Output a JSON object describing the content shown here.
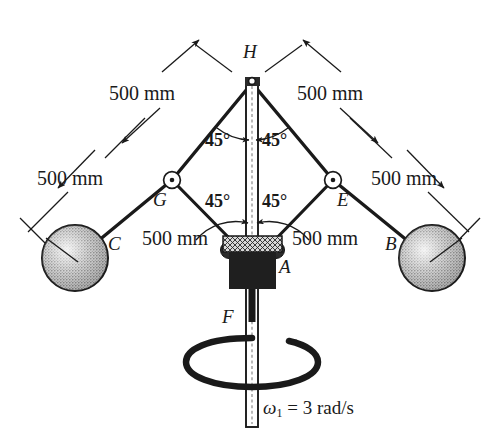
{
  "figure": {
    "type": "mechanism-diagram",
    "background_color": "#ffffff",
    "line_color": "#1a1a1a",
    "sphere_fill": "#b8b8b8"
  },
  "points": {
    "H": "H",
    "G": "G",
    "E": "E",
    "A": "A",
    "B": "B",
    "C": "C",
    "F": "F"
  },
  "dimensions": {
    "upper_left": "500 mm",
    "upper_right": "500 mm",
    "lower_left": "500 mm",
    "lower_right": "500 mm",
    "inner_left": "500 mm",
    "inner_right": "500 mm"
  },
  "angles": {
    "top_left": "45°",
    "top_right": "45°",
    "bottom_left": "45°",
    "bottom_right": "45°"
  },
  "annotations": {
    "force_label": "F",
    "omega_symbol": "ω",
    "omega_subscript": "1",
    "omega_equals": "= 3 rad/s",
    "omega_full": "ω₁ = 3 rad/s"
  },
  "geometry": {
    "apex_H": [
      252,
      82
    ],
    "joint_G": [
      172,
      180
    ],
    "joint_E": [
      333,
      180
    ],
    "collar_A": [
      252,
      248
    ],
    "sphere_C": [
      75,
      258
    ],
    "sphere_B": [
      432,
      258
    ],
    "sphere_radius": 33,
    "shaft_bottom": [
      252,
      422
    ]
  }
}
